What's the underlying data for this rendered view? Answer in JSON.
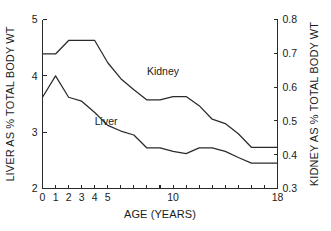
{
  "chart_data": {
    "type": "line",
    "title": "",
    "xlabel": "AGE (YEARS)",
    "ylabel": "LIVER AS % TOTAL BODY WT",
    "y2label": "KIDNEY AS % TOTAL BODY WT",
    "grid": false,
    "legend_position": "inline-annotations",
    "xlim": [
      0,
      18
    ],
    "ylim": [
      2,
      5
    ],
    "y2lim": [
      0.3,
      0.8
    ],
    "x_ticks": [
      0,
      1,
      2,
      3,
      4,
      5,
      6,
      7,
      8,
      9,
      10,
      11,
      12,
      13,
      14,
      15,
      16,
      17,
      18
    ],
    "x_tick_labels": [
      "0",
      "1",
      "2",
      "3",
      "4",
      "5",
      "",
      "",
      "",
      "",
      "10",
      "",
      "",
      "",
      "",
      "",
      "",
      "",
      "18"
    ],
    "y_ticks": [
      2,
      3,
      4,
      5
    ],
    "y_tick_labels": [
      "2",
      "3",
      "4",
      "5"
    ],
    "y2_ticks": [
      0.3,
      0.4,
      0.5,
      0.6,
      0.7,
      0.8
    ],
    "y2_tick_labels": [
      "0.3",
      "0.4",
      "0.5",
      "0.6",
      "0.7",
      "0.8"
    ],
    "x": [
      0,
      1,
      2,
      3,
      4,
      5,
      6,
      7,
      8,
      9,
      10,
      11,
      12,
      13,
      14,
      15,
      16,
      17,
      18
    ],
    "series": [
      {
        "name": "Liver",
        "axis": "left",
        "label": "Liver",
        "label_x": 4.0,
        "label_y": 3.12,
        "values": [
          3.62,
          4.0,
          3.62,
          3.55,
          3.35,
          3.12,
          3.02,
          2.95,
          2.72,
          2.72,
          2.66,
          2.62,
          2.72,
          2.72,
          2.66,
          2.55,
          2.45,
          2.45,
          2.45
        ]
      },
      {
        "name": "Kidney",
        "axis": "right",
        "label": "Kidney",
        "label_x": 8.0,
        "label_y": 0.635,
        "values": [
          0.698,
          0.698,
          0.738,
          0.738,
          0.738,
          0.672,
          0.625,
          0.592,
          0.562,
          0.562,
          0.572,
          0.572,
          0.545,
          0.505,
          0.492,
          0.462,
          0.422,
          0.422,
          0.422
        ]
      }
    ]
  }
}
